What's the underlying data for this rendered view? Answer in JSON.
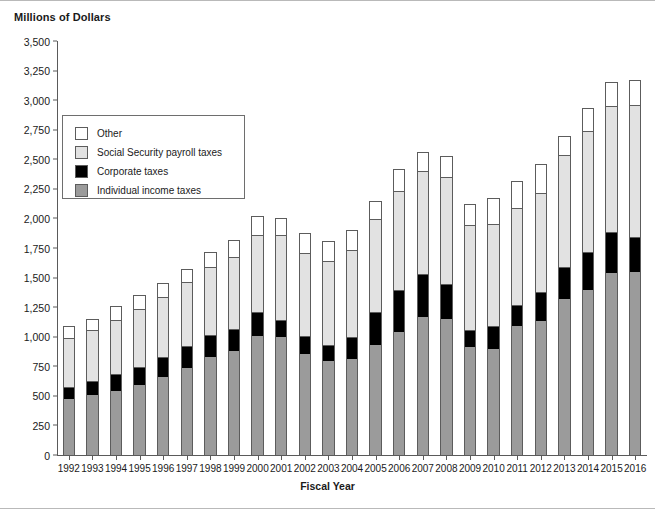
{
  "chart_title": "Millions of Dollars",
  "axis": {
    "x_title": "Fiscal Year",
    "y_ticks": [
      "3,500",
      "3,250",
      "3,000",
      "2,750",
      "2,500",
      "2,250",
      "2,000",
      "1,750",
      "1,500",
      "1,250",
      "1,000",
      "750",
      "500",
      "250",
      "0"
    ]
  },
  "legend": {
    "items": [
      {
        "label": "Other",
        "color": "#ffffff"
      },
      {
        "label": "Social Security payroll taxes",
        "color": "#e2e2e2"
      },
      {
        "label": "Corporate taxes",
        "color": "#000000"
      },
      {
        "label": "Individual income taxes",
        "color": "#9b9b9b"
      }
    ]
  },
  "chart_data": {
    "type": "bar",
    "subtype": "stacked-vertical",
    "title": "Millions of Dollars",
    "xlabel": "Fiscal Year",
    "ylabel": "Millions of Dollars",
    "ylim": [
      0,
      3500
    ],
    "ytick_step": 250,
    "grid": false,
    "legend_position": "inside-upper-left",
    "categories": [
      "1992",
      "1993",
      "1994",
      "1995",
      "1996",
      "1997",
      "1998",
      "1999",
      "2000",
      "2001",
      "2002",
      "2003",
      "2004",
      "2005",
      "2006",
      "2007",
      "2008",
      "2009",
      "2010",
      "2011",
      "2012",
      "2013",
      "2014",
      "2015",
      "2016"
    ],
    "series": [
      {
        "name": "Individual income taxes",
        "color": "#9b9b9b",
        "values": [
          476,
          510,
          543,
          590,
          656,
          737,
          829,
          879,
          1004,
          994,
          858,
          794,
          809,
          927,
          1044,
          1163,
          1146,
          915,
          899,
          1091,
          1132,
          1316,
          1395,
          1541,
          1546
        ]
      },
      {
        "name": "Corporate taxes",
        "color": "#000000",
        "values": [
          100,
          118,
          140,
          157,
          172,
          182,
          189,
          185,
          207,
          151,
          148,
          132,
          189,
          278,
          354,
          370,
          304,
          138,
          191,
          181,
          242,
          274,
          321,
          344,
          300
        ]
      },
      {
        "name": "Social Security payroll taxes",
        "color": "#e2e2e2",
        "values": [
          414,
          427,
          461,
          485,
          510,
          540,
          572,
          612,
          653,
          711,
          701,
          713,
          733,
          794,
          838,
          870,
          900,
          891,
          865,
          819,
          845,
          948,
          1023,
          1065,
          1115
        ]
      },
      {
        "name": "Other",
        "color": "#ffffff",
        "values": [
          99,
          97,
          112,
          118,
          115,
          115,
          123,
          144,
          158,
          146,
          172,
          167,
          174,
          152,
          178,
          158,
          175,
          177,
          215,
          222,
          245,
          161,
          193,
          206,
          212
        ]
      }
    ],
    "totals": [
      1089,
      1152,
      1256,
      1350,
      1453,
      1574,
      1713,
      1820,
      2022,
      2002,
      1879,
      1806,
      1905,
      2151,
      2414,
      2561,
      2525,
      2121,
      2170,
      2313,
      2464,
      2699,
      2932,
      3156,
      3173
    ]
  }
}
